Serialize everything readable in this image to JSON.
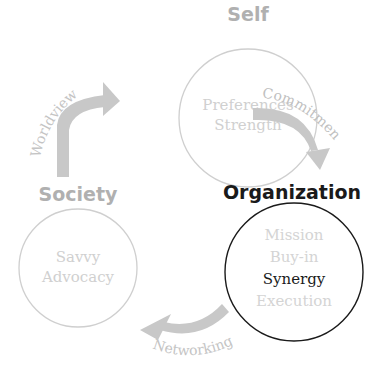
{
  "colors": {
    "muted_text": "#b3b3b3",
    "faint_text": "#d4d4d4",
    "circle_muted": "#cfcfcf",
    "arrow": "#c8c8c8",
    "active": "#1a1a1a"
  },
  "nodes": {
    "self": {
      "title": "Self",
      "items": [
        "Preferences",
        "Strength"
      ]
    },
    "organization": {
      "title": "Organization",
      "items": [
        "Mission",
        "Buy-in",
        "Synergy",
        "Execution"
      ],
      "highlighted_item": "Synergy"
    },
    "society": {
      "title": "Society",
      "items": [
        "Savvy",
        "Advocacy"
      ]
    }
  },
  "arrows": {
    "self_to_organization": "Commitment",
    "organization_to_society": "Networking",
    "society_to_self": "Worldview"
  }
}
